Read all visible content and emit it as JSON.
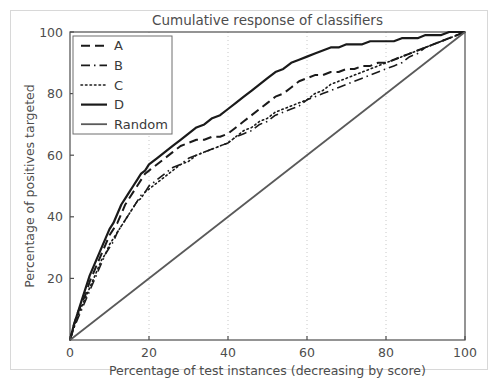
{
  "chart_data": {
    "type": "line",
    "title": "Cumulative response of classifiers",
    "xlabel": "Percentage of test instances (decreasing by score)",
    "ylabel": "Percentage of positives targeted",
    "xlim": [
      0,
      100
    ],
    "ylim": [
      0,
      100
    ],
    "xticks": [
      0,
      20,
      40,
      60,
      80,
      100
    ],
    "yticks": [
      20,
      40,
      60,
      80,
      100
    ],
    "xticklabels": [
      "0",
      "20",
      "40",
      "60",
      "80",
      "100"
    ],
    "yticklabels": [
      "20",
      "40",
      "60",
      "80",
      "100"
    ],
    "grid": "vertical-dotted",
    "legend_position": "upper-left",
    "series": [
      {
        "name": "A",
        "style": "dashed",
        "color": "#1a1a1a",
        "width": 2.0,
        "x": [
          0,
          1,
          2,
          3,
          4,
          5,
          6,
          7,
          8,
          9,
          10,
          11,
          12,
          13,
          14,
          15,
          16,
          17,
          18,
          19,
          20,
          22,
          24,
          26,
          28,
          30,
          32,
          34,
          36,
          38,
          40,
          42,
          44,
          46,
          48,
          50,
          52,
          54,
          56,
          58,
          60,
          62,
          64,
          66,
          68,
          70,
          72,
          74,
          76,
          78,
          80,
          82,
          84,
          86,
          88,
          90,
          92,
          94,
          96,
          98,
          100
        ],
        "y": [
          0,
          5,
          9,
          12,
          15,
          19,
          22,
          25,
          28,
          31,
          34,
          36,
          38,
          41,
          44,
          46,
          48,
          50,
          52,
          54,
          55,
          57,
          59,
          61,
          63,
          64,
          65,
          65,
          66,
          66,
          67,
          69,
          71,
          73,
          75,
          77,
          79,
          80,
          82,
          84,
          85,
          86,
          86,
          87,
          87,
          88,
          88,
          89,
          89,
          90,
          90,
          91,
          92,
          93,
          94,
          95,
          96,
          97,
          98,
          99,
          100
        ]
      },
      {
        "name": "B",
        "style": "dashdot",
        "color": "#1a1a1a",
        "width": 1.6,
        "x": [
          0,
          1,
          2,
          3,
          4,
          5,
          6,
          7,
          8,
          9,
          10,
          11,
          12,
          13,
          14,
          15,
          16,
          17,
          18,
          19,
          20,
          22,
          24,
          26,
          28,
          30,
          32,
          34,
          36,
          38,
          40,
          42,
          44,
          46,
          48,
          50,
          52,
          54,
          56,
          58,
          60,
          62,
          64,
          66,
          68,
          70,
          72,
          74,
          76,
          78,
          80,
          82,
          84,
          86,
          88,
          90,
          92,
          94,
          96,
          98,
          100
        ],
        "y": [
          0,
          4,
          7,
          10,
          13,
          16,
          19,
          22,
          25,
          28,
          30,
          32,
          35,
          37,
          39,
          41,
          43,
          45,
          47,
          48,
          50,
          52,
          54,
          56,
          57,
          59,
          60,
          61,
          62,
          63,
          64,
          66,
          67,
          68,
          70,
          71,
          73,
          74,
          75,
          76,
          78,
          79,
          80,
          81,
          82,
          83,
          84,
          85,
          86,
          87,
          88,
          89,
          90,
          92,
          93,
          95,
          96,
          97,
          98,
          99,
          100
        ]
      },
      {
        "name": "C",
        "style": "dotted",
        "color": "#1a1a1a",
        "width": 1.6,
        "x": [
          0,
          1,
          2,
          3,
          4,
          5,
          6,
          7,
          8,
          9,
          10,
          11,
          12,
          13,
          14,
          15,
          16,
          17,
          18,
          19,
          20,
          22,
          24,
          26,
          28,
          30,
          32,
          34,
          36,
          38,
          40,
          42,
          44,
          46,
          48,
          50,
          52,
          54,
          56,
          58,
          60,
          62,
          64,
          66,
          68,
          70,
          72,
          74,
          76,
          78,
          80,
          82,
          84,
          86,
          88,
          90,
          92,
          94,
          96,
          98,
          100
        ],
        "y": [
          0,
          4,
          8,
          11,
          14,
          17,
          20,
          23,
          26,
          28,
          31,
          33,
          35,
          37,
          39,
          41,
          43,
          45,
          46,
          48,
          49,
          51,
          53,
          55,
          57,
          58,
          60,
          61,
          62,
          63,
          64,
          66,
          68,
          69,
          71,
          72,
          74,
          75,
          76,
          77,
          78,
          80,
          81,
          83,
          84,
          85,
          86,
          87,
          88,
          89,
          90,
          91,
          92,
          93,
          94,
          95,
          96,
          97,
          98,
          99,
          100
        ]
      },
      {
        "name": "D",
        "style": "solid",
        "color": "#1a1a1a",
        "width": 2.2,
        "x": [
          0,
          1,
          2,
          3,
          4,
          5,
          6,
          7,
          8,
          9,
          10,
          11,
          12,
          13,
          14,
          15,
          16,
          17,
          18,
          19,
          20,
          22,
          24,
          26,
          28,
          30,
          32,
          34,
          36,
          38,
          40,
          42,
          44,
          46,
          48,
          50,
          52,
          54,
          56,
          58,
          60,
          62,
          64,
          66,
          68,
          70,
          72,
          74,
          76,
          78,
          80,
          82,
          84,
          86,
          88,
          90,
          92,
          94,
          96,
          98,
          100
        ],
        "y": [
          0,
          5,
          9,
          13,
          17,
          21,
          24,
          27,
          30,
          33,
          36,
          38,
          41,
          44,
          46,
          48,
          50,
          52,
          54,
          55,
          57,
          59,
          61,
          63,
          65,
          67,
          69,
          70,
          72,
          73,
          75,
          77,
          79,
          81,
          83,
          85,
          87,
          88,
          90,
          91,
          92,
          93,
          94,
          95,
          95,
          96,
          96,
          96,
          97,
          97,
          97,
          97,
          98,
          98,
          98,
          99,
          99,
          99,
          100,
          100,
          100
        ]
      },
      {
        "name": "Random",
        "style": "solid",
        "color": "#5a5a5a",
        "width": 1.8,
        "x": [
          0,
          100
        ],
        "y": [
          0,
          100
        ]
      }
    ]
  },
  "legend": {
    "entries": [
      {
        "label": "A"
      },
      {
        "label": "B"
      },
      {
        "label": "C"
      },
      {
        "label": "D"
      },
      {
        "label": "Random"
      }
    ]
  },
  "colors": {
    "axis": "#4d4d4d",
    "grid": "#c8c8c8",
    "figure_border": "#d8d8d8",
    "background": "#ffffff"
  }
}
